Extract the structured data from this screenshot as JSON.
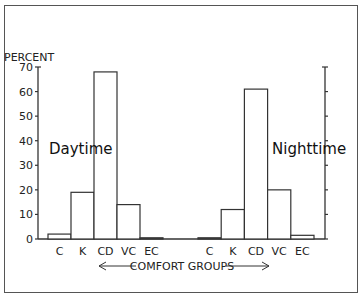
{
  "chart_data": {
    "type": "bar",
    "title": "",
    "ylabel": "PERCENT",
    "xlabel": "COMFORT GROUPS",
    "ylim": [
      0,
      70
    ],
    "yticks": [
      0,
      10,
      20,
      30,
      40,
      50,
      60,
      70
    ],
    "grid": false,
    "categories": [
      "C",
      "K",
      "CD",
      "VC",
      "EC"
    ],
    "series": [
      {
        "name": "Daytime",
        "values": [
          2,
          19,
          68,
          14,
          0.5
        ]
      },
      {
        "name": "Nighttime",
        "values": [
          0.5,
          12,
          61,
          20,
          1.5
        ]
      }
    ],
    "annotations": [
      "Daytime",
      "Nighttime",
      "← COMFORT GROUPS →"
    ]
  },
  "labels": {
    "ylabel": "PERCENT",
    "xlabel": "COMFORT GROUPS",
    "day": "Daytime",
    "night": "Nighttime"
  }
}
